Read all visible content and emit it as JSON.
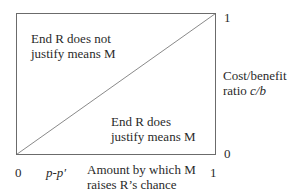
{
  "diagram": {
    "regions": {
      "upper_left": [
        "End R does not",
        "justify means M"
      ],
      "lower_right": [
        "End R does",
        "justify means M"
      ]
    },
    "y_axis": {
      "label_line1": "Cost/benefit",
      "label_line2_prefix": "ratio ",
      "label_line2_var": "c/b",
      "top_tick": "1",
      "bottom_tick": "0"
    },
    "x_axis": {
      "origin_tick": "0",
      "marker": "p-p′",
      "label_line1": "Amount by which M",
      "label_line2": "raises R’s chance",
      "end_tick": "1"
    },
    "colors": {
      "line": "#6b6b6b",
      "text": "#2a2a2a"
    }
  }
}
